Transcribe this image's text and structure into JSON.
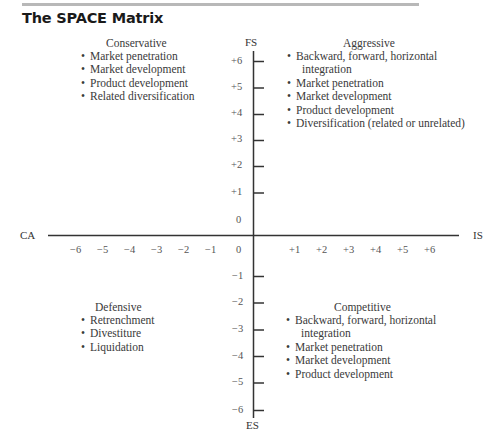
{
  "title": "The SPACE Matrix",
  "axes": {
    "top": "FS",
    "bottom": "ES",
    "left": "CA",
    "right": "IS"
  },
  "y_ticks_positive": [
    "+6",
    "+5",
    "+4",
    "+3",
    "+2",
    "+1",
    "0"
  ],
  "y_ticks_negative": [
    "-1",
    "-2",
    "-3",
    "-4",
    "-5",
    "-6"
  ],
  "x_ticks_negative": [
    "−6",
    "−5",
    "−4",
    "−3",
    "−2",
    "−1",
    "0"
  ],
  "x_ticks_positive": [
    "+1",
    "+2",
    "+3",
    "+4",
    "+5",
    "+6"
  ],
  "y_ticks_negative_display": [
    "−1",
    "−2",
    "−3",
    "−4",
    "−5",
    "−6"
  ],
  "quadrants": {
    "conservative": {
      "title": "Conservative",
      "items": [
        "Market penetration",
        "Market development",
        "Product development",
        "Related diversification"
      ]
    },
    "aggressive": {
      "title": "Aggressive",
      "items": [
        "Backward, forward, horizontal",
        "integration",
        "Market penetration",
        "Market development",
        "Product development",
        "Diversification (related or unrelated)"
      ]
    },
    "defensive": {
      "title": "Defensive",
      "items": [
        "Retrenchment",
        "Divestiture",
        "Liquidation"
      ]
    },
    "competitive": {
      "title": "Competitive",
      "items": [
        "Backward, forward, horizontal",
        "integration",
        "Market penetration",
        "Market development",
        "Product development"
      ]
    }
  },
  "bullet": "•",
  "colors": {
    "axis": "#333333",
    "text": "#3a3a3a",
    "rule": "#b8b8b8"
  }
}
